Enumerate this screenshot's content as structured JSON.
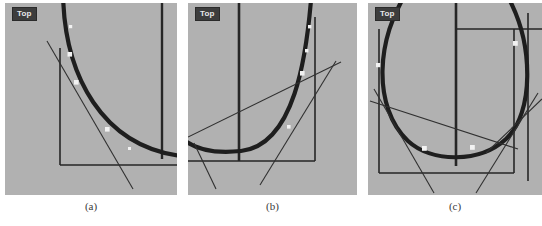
{
  "figure": {
    "background": "#ffffff",
    "panel_background": "#b1b1b1",
    "curve_color": "#1e1e1e",
    "line_color": "#262626",
    "marker_color": "#f2f2f2",
    "badge_background": "#3d3d3d",
    "badge_text_color": "#e8e8e8",
    "panel_count": 3
  },
  "panels": [
    {
      "id": "a",
      "caption": "(a)",
      "badge_label": "Top",
      "view": "Top",
      "description": "Circular arc entering from top, curving down to the right; one straight tangent line crossing it; rectangular frame with vertical right edge and horizontal bottom edge; four white square markers on the arc",
      "marker_count": 4
    },
    {
      "id": "b",
      "caption": "(b)",
      "badge_label": "Top",
      "view": "Top",
      "description": "Circular arc forming a U shape, bottom of circle visible; two straight tangent lines crossing near lower right; rectangular frame with vertical left edge, vertical right edge and horizontal bottom edge; four white square markers on the arc",
      "marker_count": 4
    },
    {
      "id": "c",
      "caption": "(c)",
      "badge_label": "Top",
      "view": "Top",
      "description": "Full circular arc forming a wide U, vertical center line, two straight tangent lines crossing at lower left and lower right; rectangular frame; four white square markers on the arc",
      "marker_count": 4
    }
  ]
}
